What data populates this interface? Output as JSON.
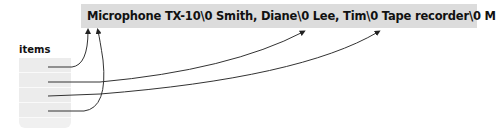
{
  "banner": {
    "text": "Microphone TX-10\\0 Smith, Diane\\0 Lee, Tim\\0 Tape recorder\\0 Mini DVI cable\\0 ...",
    "background": "#dcdcdc"
  },
  "array": {
    "label": "items",
    "cells": 4,
    "pointers": [
      {
        "from_cell": 0,
        "target": "Microphone TX-10"
      },
      {
        "from_cell": 1,
        "target": "Tape recorder"
      },
      {
        "from_cell": 2,
        "target": "Mini DVI cable"
      },
      {
        "from_cell": 3,
        "target": "Microphone TX-10"
      }
    ]
  }
}
